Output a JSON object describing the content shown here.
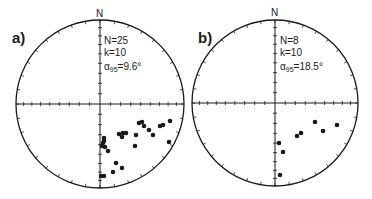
{
  "chart_data": [
    {
      "type": "scatter",
      "projection": "equal-area stereonet (lower hemisphere)",
      "panel_label": "a)",
      "north_label": "N",
      "stats": {
        "N": "N=25",
        "k": "k=10",
        "alpha95_symbol": "α",
        "alpha95_sub": "95",
        "alpha95_value": "=9.6°"
      },
      "center": [
        100,
        104
      ],
      "radius": 84,
      "points": [
        [
          139,
          123
        ],
        [
          142,
          122
        ],
        [
          144,
          126
        ],
        [
          149,
          130
        ],
        [
          153,
          135
        ],
        [
          136,
          135
        ],
        [
          135,
          146
        ],
        [
          119,
          134
        ],
        [
          123,
          133
        ],
        [
          126,
          133
        ],
        [
          122,
          137
        ],
        [
          160,
          126
        ],
        [
          163,
          125
        ],
        [
          170,
          121
        ],
        [
          169,
          142
        ],
        [
          104,
          138
        ],
        [
          104,
          141
        ],
        [
          103,
          143
        ],
        [
          102,
          146
        ],
        [
          105,
          147
        ],
        [
          108,
          151
        ],
        [
          116,
          163
        ],
        [
          113,
          172
        ],
        [
          122,
          168
        ],
        [
          101,
          176
        ],
        [
          104,
          176
        ]
      ]
    },
    {
      "type": "scatter",
      "projection": "equal-area stereonet (lower hemisphere)",
      "panel_label": "b)",
      "north_label": "N",
      "stats": {
        "N": "N=8",
        "k": "k=10",
        "alpha95_symbol": "α",
        "alpha95_sub": "95",
        "alpha95_value": "=18.5°"
      },
      "center": [
        275,
        103
      ],
      "radius": 83,
      "points": [
        [
          315,
          122
        ],
        [
          337,
          125
        ],
        [
          323,
          131
        ],
        [
          301,
          133
        ],
        [
          297,
          136
        ],
        [
          279,
          143
        ],
        [
          283,
          152
        ],
        [
          280,
          175
        ]
      ]
    }
  ]
}
